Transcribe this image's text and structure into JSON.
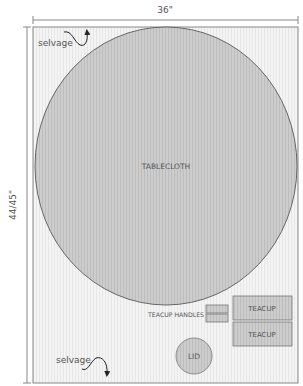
{
  "diagram": {
    "width_label": "36\"",
    "height_label": "44/45\"",
    "selvage_top": "selvage",
    "selvage_bottom": "selvage",
    "pieces": {
      "tablecloth": "TABLECLOTH",
      "teacup_handles": "TEACUP HANDLES",
      "teacup_1": "TEACUP",
      "teacup_2": "TEACUP",
      "lid": "LID"
    },
    "colors": {
      "fabric": "#f2f2f2",
      "piece_fill": "#cfcfcf",
      "outline": "#777777",
      "text": "#555555"
    }
  }
}
